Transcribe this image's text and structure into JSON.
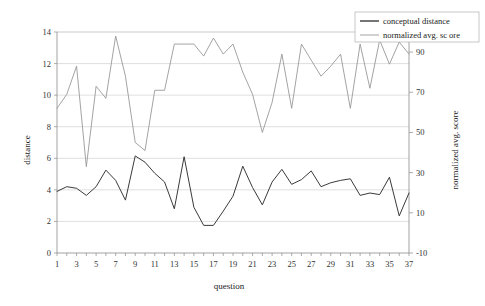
{
  "chart_data": {
    "type": "line",
    "title": "",
    "xlabel": "question",
    "ylabel": "distance",
    "y2label": "normalized avg. score",
    "xlim": [
      1,
      37
    ],
    "ylim": [
      0,
      14
    ],
    "y2lim": [
      -10,
      100
    ],
    "grid": true,
    "legend_position": "top-right",
    "x": [
      1,
      2,
      3,
      4,
      5,
      6,
      7,
      8,
      9,
      10,
      11,
      12,
      13,
      14,
      15,
      16,
      17,
      18,
      19,
      20,
      21,
      22,
      23,
      24,
      25,
      26,
      27,
      28,
      29,
      30,
      31,
      32,
      33,
      34,
      35,
      36,
      37
    ],
    "xticks": [
      1,
      3,
      5,
      7,
      9,
      11,
      13,
      15,
      17,
      19,
      21,
      23,
      25,
      27,
      29,
      31,
      33,
      35,
      37
    ],
    "yticks": [
      0,
      2,
      4,
      6,
      8,
      10,
      12,
      14
    ],
    "y2ticks": [
      -10,
      10,
      30,
      50,
      70,
      90
    ],
    "series": [
      {
        "name": "conceptual distance",
        "axis": "left",
        "color": "#3a3a3a",
        "width": 1.0,
        "values": [
          3.9,
          4.2,
          4.1,
          3.65,
          4.2,
          5.25,
          4.6,
          3.35,
          6.15,
          5.75,
          5.05,
          4.5,
          2.8,
          6.1,
          2.9,
          1.75,
          1.75,
          2.65,
          3.6,
          5.5,
          4.15,
          3.05,
          4.5,
          5.3,
          4.35,
          4.65,
          5.2,
          4.2,
          4.45,
          4.6,
          4.7,
          3.65,
          3.8,
          3.7,
          4.8,
          2.35,
          3.8
        ]
      },
      {
        "name": "normalized avg. sc ore",
        "axis": "right",
        "color": "#999999",
        "width": 0.9,
        "values": [
          62,
          69,
          83,
          33,
          73,
          67,
          98,
          78,
          45,
          41,
          71,
          71,
          94,
          94,
          94,
          88,
          97,
          89,
          94,
          80,
          69,
          50,
          65,
          89,
          62,
          94,
          86,
          78,
          83,
          89,
          62,
          94,
          72,
          96,
          84,
          95,
          89
        ]
      }
    ],
    "legend": [
      {
        "label": "conceptual distance",
        "color": "#3a3a3a",
        "marker": "line-thick"
      },
      {
        "label": "normalized avg. sc ore",
        "color": "#999999",
        "marker": "line-thin"
      }
    ]
  }
}
